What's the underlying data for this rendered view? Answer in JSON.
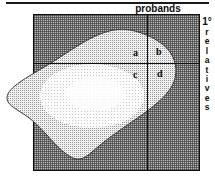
{
  "figure": {
    "axis_top_label": "probands",
    "axis_right": {
      "degree": "1°",
      "word_letters": [
        "r",
        "e",
        "l",
        "a",
        "t",
        "i",
        "v",
        "e",
        "s"
      ],
      "word": "relatives"
    },
    "quadrant_cells": [
      {
        "key": "a",
        "label": "a",
        "position": "upper-left"
      },
      {
        "key": "b",
        "label": "b",
        "position": "upper-right"
      },
      {
        "key": "c",
        "label": "c",
        "position": "lower-left"
      },
      {
        "key": "d",
        "label": "d",
        "position": "lower-right"
      }
    ],
    "colors": {
      "square_fill": "#b9b9b9",
      "blob_fill": "#e9e9e9",
      "blob_core": "#fbfbfb",
      "line": "#111111",
      "text": "#0d0d0d"
    }
  }
}
